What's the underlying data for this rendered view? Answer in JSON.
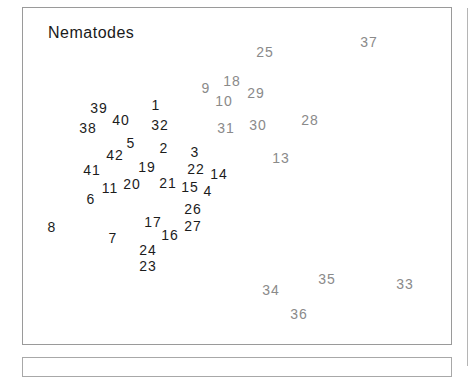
{
  "chart_data": {
    "type": "scatter",
    "title": "Nematodes",
    "xlabel": "",
    "ylabel": "",
    "grid": false,
    "legend": null,
    "colors": {
      "group_dark": "#1c1c1c",
      "group_gray": "#8a8a8a"
    },
    "points": [
      {
        "label": "1",
        "x": 156,
        "y": 105,
        "group": "dark"
      },
      {
        "label": "2",
        "x": 164,
        "y": 148,
        "group": "dark"
      },
      {
        "label": "3",
        "x": 195,
        "y": 152,
        "group": "dark"
      },
      {
        "label": "4",
        "x": 208,
        "y": 191,
        "group": "dark"
      },
      {
        "label": "5",
        "x": 131,
        "y": 143,
        "group": "dark"
      },
      {
        "label": "6",
        "x": 91,
        "y": 199,
        "group": "dark"
      },
      {
        "label": "7",
        "x": 113,
        "y": 238,
        "group": "dark"
      },
      {
        "label": "8",
        "x": 52,
        "y": 227,
        "group": "dark"
      },
      {
        "label": "9",
        "x": 206,
        "y": 88,
        "group": "gray"
      },
      {
        "label": "10",
        "x": 224,
        "y": 101,
        "group": "gray"
      },
      {
        "label": "11",
        "x": 110,
        "y": 188,
        "group": "dark"
      },
      {
        "label": "13",
        "x": 281,
        "y": 158,
        "group": "gray"
      },
      {
        "label": "14",
        "x": 219,
        "y": 174,
        "group": "dark"
      },
      {
        "label": "15",
        "x": 190,
        "y": 187,
        "group": "dark"
      },
      {
        "label": "16",
        "x": 170,
        "y": 235,
        "group": "dark"
      },
      {
        "label": "17",
        "x": 153,
        "y": 222,
        "group": "dark"
      },
      {
        "label": "18",
        "x": 232,
        "y": 81,
        "group": "gray"
      },
      {
        "label": "19",
        "x": 147,
        "y": 167,
        "group": "dark"
      },
      {
        "label": "20",
        "x": 132,
        "y": 184,
        "group": "dark"
      },
      {
        "label": "21",
        "x": 168,
        "y": 183,
        "group": "dark"
      },
      {
        "label": "22",
        "x": 196,
        "y": 169,
        "group": "dark"
      },
      {
        "label": "23",
        "x": 148,
        "y": 266,
        "group": "dark"
      },
      {
        "label": "24",
        "x": 148,
        "y": 250,
        "group": "dark"
      },
      {
        "label": "25",
        "x": 265,
        "y": 52,
        "group": "gray"
      },
      {
        "label": "26",
        "x": 193,
        "y": 209,
        "group": "dark"
      },
      {
        "label": "27",
        "x": 193,
        "y": 226,
        "group": "dark"
      },
      {
        "label": "28",
        "x": 310,
        "y": 120,
        "group": "gray"
      },
      {
        "label": "29",
        "x": 256,
        "y": 93,
        "group": "gray"
      },
      {
        "label": "30",
        "x": 258,
        "y": 125,
        "group": "gray"
      },
      {
        "label": "31",
        "x": 226,
        "y": 128,
        "group": "gray"
      },
      {
        "label": "32",
        "x": 160,
        "y": 125,
        "group": "dark"
      },
      {
        "label": "33",
        "x": 405,
        "y": 284,
        "group": "gray"
      },
      {
        "label": "34",
        "x": 271,
        "y": 290,
        "group": "gray"
      },
      {
        "label": "35",
        "x": 327,
        "y": 279,
        "group": "gray"
      },
      {
        "label": "36",
        "x": 299,
        "y": 314,
        "group": "gray"
      },
      {
        "label": "37",
        "x": 369,
        "y": 42,
        "group": "gray"
      },
      {
        "label": "38",
        "x": 88,
        "y": 128,
        "group": "dark"
      },
      {
        "label": "39",
        "x": 99,
        "y": 108,
        "group": "dark"
      },
      {
        "label": "40",
        "x": 121,
        "y": 120,
        "group": "dark"
      },
      {
        "label": "41",
        "x": 92,
        "y": 170,
        "group": "dark"
      },
      {
        "label": "42",
        "x": 115,
        "y": 155,
        "group": "dark"
      }
    ]
  }
}
